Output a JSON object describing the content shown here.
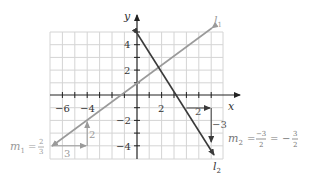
{
  "axes": {
    "x_label": "x",
    "y_label": "y",
    "x_ticks": [
      "−6",
      "−4",
      "2"
    ],
    "y_ticks": [
      "4",
      "2",
      "−2",
      "−4"
    ],
    "xlim": [
      -7,
      7
    ],
    "ylim": [
      -5,
      5
    ]
  },
  "lines": {
    "l1": {
      "label": "l",
      "sub": "1",
      "color": "#9a9a9a",
      "slope_text": {
        "m": "m",
        "sub": "1",
        "eq": "=",
        "num": "2",
        "den": "3"
      },
      "rise": "2",
      "run": "3"
    },
    "l2": {
      "label": "l",
      "sub": "2",
      "color": "#3a3a3a",
      "slope_text": {
        "m": "m",
        "sub": "2",
        "eq1": "=",
        "num1": "−3",
        "den1": "2",
        "eq2": "=",
        "neg": "−",
        "num2": "3",
        "den2": "2"
      },
      "rise": "−3",
      "run": "2"
    }
  },
  "colors": {
    "grid": "#d4d4d4",
    "axis": "#222222",
    "l1": "#9a9a9a",
    "l2": "#3a3a3a",
    "annot": "#9a9a9a"
  }
}
